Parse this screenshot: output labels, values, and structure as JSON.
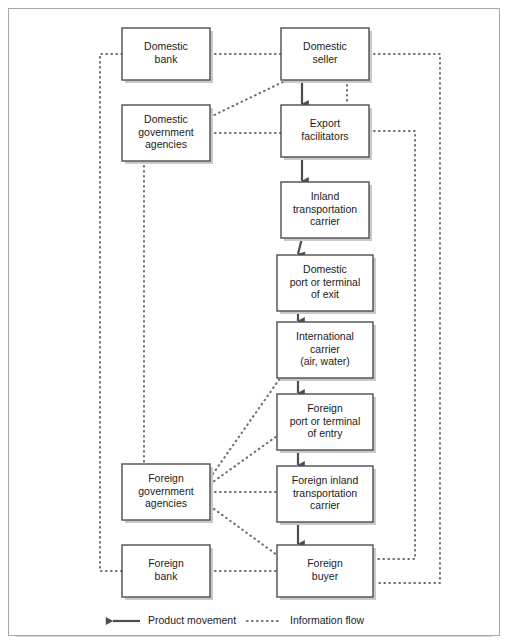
{
  "figure": {
    "frame_color": "#a8a8a8",
    "box_border_color": "#4d4d4d",
    "line_color": "#4d4d4d",
    "info_line_color": "#6e6e6e"
  },
  "nodes": [
    {
      "id": "domestic-bank",
      "label_lines": [
        "Domestic",
        "bank"
      ],
      "x": 122,
      "y": 28,
      "w": 88,
      "h": 52
    },
    {
      "id": "domestic-seller",
      "label_lines": [
        "Domestic",
        "seller"
      ],
      "x": 281,
      "y": 28,
      "w": 88,
      "h": 52
    },
    {
      "id": "domestic-gov-agencies",
      "label_lines": [
        "Domestic",
        "government",
        "agencies"
      ],
      "x": 122,
      "y": 105,
      "w": 88,
      "h": 56
    },
    {
      "id": "export-facilitators",
      "label_lines": [
        "Export",
        "facilitators"
      ],
      "x": 281,
      "y": 105,
      "w": 88,
      "h": 52
    },
    {
      "id": "inland-transport-carrier",
      "label_lines": [
        "Inland",
        "transportation",
        "carrier"
      ],
      "x": 281,
      "y": 182,
      "w": 88,
      "h": 56
    },
    {
      "id": "domestic-port-exit",
      "label_lines": [
        "Domestic",
        "port or terminal",
        "of exit"
      ],
      "x": 277,
      "y": 255,
      "w": 96,
      "h": 56
    },
    {
      "id": "international-carrier",
      "label_lines": [
        "International",
        "carrier",
        "(air, water)"
      ],
      "x": 277,
      "y": 322,
      "w": 96,
      "h": 56
    },
    {
      "id": "foreign-port-entry",
      "label_lines": [
        "Foreign",
        "port or terminal",
        "of entry"
      ],
      "x": 277,
      "y": 394,
      "w": 96,
      "h": 56
    },
    {
      "id": "foreign-gov-agencies",
      "label_lines": [
        "Foreign",
        "government",
        "agencies"
      ],
      "x": 122,
      "y": 464,
      "w": 88,
      "h": 56
    },
    {
      "id": "foreign-inland-carrier",
      "label_lines": [
        "Foreign inland",
        "transportation",
        "carrier"
      ],
      "x": 277,
      "y": 466,
      "w": 96,
      "h": 56
    },
    {
      "id": "foreign-bank",
      "label_lines": [
        "Foreign",
        "bank"
      ],
      "x": 122,
      "y": 545,
      "w": 88,
      "h": 52
    },
    {
      "id": "foreign-buyer",
      "label_lines": [
        "Foreign",
        "buyer"
      ],
      "x": 277,
      "y": 545,
      "w": 96,
      "h": 52
    }
  ],
  "product_flows": [
    {
      "from": "domestic-seller",
      "to": "export-facilitators"
    },
    {
      "from": "export-facilitators",
      "to": "inland-transport-carrier"
    },
    {
      "from": "inland-transport-carrier",
      "to": "domestic-port-exit"
    },
    {
      "from": "domestic-port-exit",
      "to": "international-carrier"
    },
    {
      "from": "international-carrier",
      "to": "foreign-port-entry"
    },
    {
      "from": "foreign-port-entry",
      "to": "foreign-inland-carrier"
    },
    {
      "from": "foreign-inland-carrier",
      "to": "foreign-buyer"
    }
  ],
  "information_flows": [
    {
      "from": "domestic-bank",
      "to": "domestic-seller",
      "kind": "horizontal"
    },
    {
      "from": "domestic-gov-agencies",
      "to": "export-facilitators",
      "kind": "horizontal"
    },
    {
      "from": "domestic-gov-agencies",
      "to": "domestic-seller",
      "kind": "diagonal"
    },
    {
      "from": "domestic-gov-agencies",
      "to": "foreign-gov-agencies",
      "kind": "vertical"
    },
    {
      "from": "domestic-bank",
      "to": "foreign-bank",
      "kind": "left-channel"
    },
    {
      "from": "foreign-bank",
      "to": "foreign-buyer",
      "kind": "horizontal"
    },
    {
      "from": "foreign-gov-agencies",
      "to": "foreign-inland-carrier",
      "kind": "horizontal"
    },
    {
      "from": "foreign-gov-agencies",
      "to": "international-carrier",
      "kind": "diagonal"
    },
    {
      "from": "foreign-gov-agencies",
      "to": "foreign-port-entry",
      "kind": "diagonal"
    },
    {
      "from": "foreign-gov-agencies",
      "to": "foreign-buyer",
      "kind": "diagonal"
    },
    {
      "from": "domestic-seller",
      "to": "foreign-buyer",
      "kind": "right-outer-channel"
    },
    {
      "from": "export-facilitators",
      "to": "foreign-buyer",
      "kind": "right-inner-channel"
    },
    {
      "from": "domestic-seller",
      "to": "export-facilitators",
      "kind": "vertical-stub"
    }
  ],
  "legend": {
    "product_movement": "Product movement",
    "information_flow": "Information flow"
  }
}
